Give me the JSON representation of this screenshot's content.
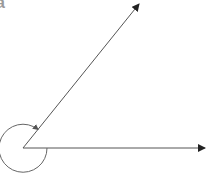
{
  "diagram": {
    "type": "reflex-angle",
    "label": "a",
    "colors": {
      "line": "#444444",
      "label": "#9a9a9a"
    },
    "vertex": [
      23,
      148
    ],
    "rays": [
      {
        "name": "upper-ray",
        "end": [
          139,
          3
        ]
      },
      {
        "name": "horizontal-ray",
        "end": [
          205,
          148
        ]
      }
    ],
    "arc": {
      "radius": 24,
      "direction": "clockwise-from-horizontal-to-upper"
    }
  }
}
